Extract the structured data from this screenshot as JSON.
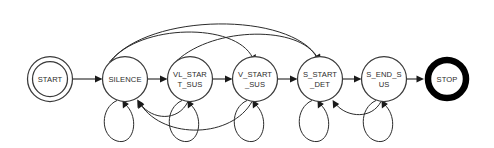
{
  "diagram": {
    "type": "finite-state-machine",
    "title": "",
    "width": 494,
    "height": 148,
    "background_color": "#ffffff",
    "stroke_color": "#2b2b2b",
    "accept_stroke_color": "#000000",
    "nodes": [
      {
        "id": "START",
        "label_lines": [
          "START"
        ],
        "line1": "START",
        "line2": "",
        "shape": "double-circle",
        "role": "initial",
        "cx": 50,
        "cy": 79,
        "r": 22.5,
        "r_inner": 17.5
      },
      {
        "id": "SILENCE",
        "label_lines": [
          "SILENCE"
        ],
        "line1": "SILENCE",
        "line2": "",
        "shape": "circle",
        "role": "state",
        "cx": 125,
        "cy": 79,
        "r": 22.5
      },
      {
        "id": "VL_START_SUS",
        "label_lines": [
          "VL_STAR",
          "T_SUS"
        ],
        "line1": "VL_STAR",
        "line2": "T_SUS",
        "shape": "circle",
        "role": "state",
        "cx": 190,
        "cy": 79,
        "r": 22.5
      },
      {
        "id": "V_START_SUS",
        "label_lines": [
          "V_START",
          "_SUS"
        ],
        "line1": "V_START",
        "line2": "_SUS",
        "shape": "circle",
        "role": "state",
        "cx": 255,
        "cy": 79,
        "r": 22.5
      },
      {
        "id": "S_START_DET",
        "label_lines": [
          "S_START",
          "_DET"
        ],
        "line1": "S_START",
        "line2": "_DET",
        "shape": "circle",
        "role": "state",
        "cx": 320,
        "cy": 79,
        "r": 22.5
      },
      {
        "id": "S_END_SUS",
        "label_lines": [
          "S_END_S",
          "US"
        ],
        "line1": "S_END_S",
        "line2": "US",
        "shape": "circle",
        "role": "state",
        "cx": 384,
        "cy": 79,
        "r": 22.5
      },
      {
        "id": "STOP",
        "label_lines": [
          "STOP"
        ],
        "line1": "STOP",
        "line2": "",
        "shape": "thick-circle",
        "role": "final",
        "cx": 447,
        "cy": 79,
        "r": 19
      }
    ],
    "edges": [
      {
        "id": "e-start-silence",
        "from": "START",
        "to": "SILENCE",
        "kind": "straight-right"
      },
      {
        "id": "e-silence-vlstart",
        "from": "SILENCE",
        "to": "VL_START_SUS",
        "kind": "straight-right"
      },
      {
        "id": "e-vlstart-vstart",
        "from": "VL_START_SUS",
        "to": "V_START_SUS",
        "kind": "straight-right"
      },
      {
        "id": "e-vstart-sstart",
        "from": "V_START_SUS",
        "to": "S_START_DET",
        "kind": "straight-right"
      },
      {
        "id": "e-sstart-send",
        "from": "S_START_DET",
        "to": "S_END_SUS",
        "kind": "straight-right"
      },
      {
        "id": "e-send-stop",
        "from": "S_END_SUS",
        "to": "STOP",
        "kind": "straight-right"
      },
      {
        "id": "e-silence-vstart-top",
        "from": "SILENCE",
        "to": "V_START_SUS",
        "kind": "arc-above"
      },
      {
        "id": "e-silence-sstart-top",
        "from": "SILENCE",
        "to": "S_START_DET",
        "kind": "arc-above"
      },
      {
        "id": "e-vlstart-sstart-top",
        "from": "VL_START_SUS",
        "to": "S_START_DET",
        "kind": "arc-above"
      },
      {
        "id": "e-vlstart-silence-bot",
        "from": "VL_START_SUS",
        "to": "SILENCE",
        "kind": "arc-below-return"
      },
      {
        "id": "e-vstart-silence-bot",
        "from": "V_START_SUS",
        "to": "SILENCE",
        "kind": "arc-below-return"
      },
      {
        "id": "e-send-sstart-bot",
        "from": "S_END_SUS",
        "to": "S_START_DET",
        "kind": "arc-below-return"
      },
      {
        "id": "loop-silence",
        "from": "SILENCE",
        "to": "SILENCE",
        "kind": "self-loop-below"
      },
      {
        "id": "loop-vlstart",
        "from": "VL_START_SUS",
        "to": "VL_START_SUS",
        "kind": "self-loop-below"
      },
      {
        "id": "loop-vstart",
        "from": "V_START_SUS",
        "to": "V_START_SUS",
        "kind": "self-loop-below"
      },
      {
        "id": "loop-sstart",
        "from": "S_START_DET",
        "to": "S_START_DET",
        "kind": "self-loop-below"
      },
      {
        "id": "loop-send",
        "from": "S_END_SUS",
        "to": "S_END_SUS",
        "kind": "self-loop-below"
      }
    ]
  }
}
